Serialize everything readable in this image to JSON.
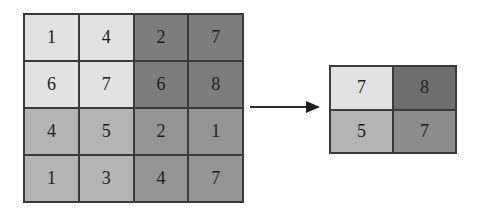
{
  "diagram": {
    "type": "max-pooling 2x2",
    "input": {
      "rows": [
        [
          {
            "value": "1",
            "color": "#e2e2e2"
          },
          {
            "value": "4",
            "color": "#e2e2e2"
          },
          {
            "value": "2",
            "color": "#7d7d7d"
          },
          {
            "value": "7",
            "color": "#7d7d7d"
          }
        ],
        [
          {
            "value": "6",
            "color": "#e2e2e2"
          },
          {
            "value": "7",
            "color": "#e2e2e2"
          },
          {
            "value": "6",
            "color": "#7d7d7d"
          },
          {
            "value": "8",
            "color": "#7d7d7d"
          }
        ],
        [
          {
            "value": "4",
            "color": "#b4b4b4"
          },
          {
            "value": "5",
            "color": "#b4b4b4"
          },
          {
            "value": "2",
            "color": "#949494"
          },
          {
            "value": "1",
            "color": "#949494"
          }
        ],
        [
          {
            "value": "1",
            "color": "#b4b4b4"
          },
          {
            "value": "3",
            "color": "#b4b4b4"
          },
          {
            "value": "4",
            "color": "#949494"
          },
          {
            "value": "7",
            "color": "#949494"
          }
        ]
      ]
    },
    "arrow": {
      "direction": "right",
      "color": "#2b2b2b"
    },
    "output": {
      "rows": [
        [
          {
            "value": "7",
            "color": "#e2e2e2"
          },
          {
            "value": "8",
            "color": "#6e6e6e"
          }
        ],
        [
          {
            "value": "5",
            "color": "#b4b4b4"
          },
          {
            "value": "7",
            "color": "#8c8c8c"
          }
        ]
      ]
    }
  }
}
